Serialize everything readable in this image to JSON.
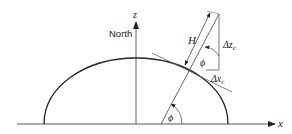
{
  "diagram": {
    "axes": {
      "x_label": "x",
      "z_label": "z",
      "north_label": "North"
    },
    "labels": {
      "height": "H",
      "angle_top": "ϕ",
      "angle_bottom": "ϕ",
      "delta_z": "Δz",
      "delta_z_sub": "c",
      "delta_x": "Δx",
      "delta_x_sub": "c"
    },
    "colors": {
      "stroke": "#222222",
      "background": "#ffffff"
    }
  }
}
